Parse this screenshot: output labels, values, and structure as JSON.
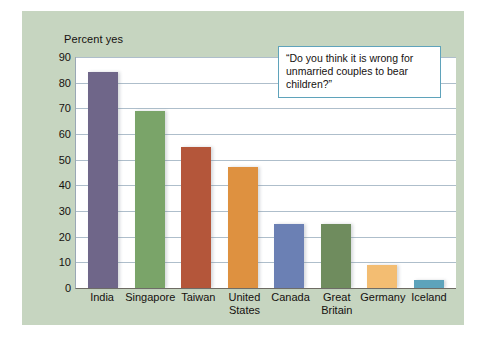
{
  "chart_data": {
    "type": "bar",
    "title": "",
    "annotation": "“Do you think it is wrong for unmarried couples to bear children?”",
    "xlabel": "",
    "ylabel": "Percent yes",
    "ylim": [
      0,
      90
    ],
    "ytick_step": 10,
    "yticks": [
      90,
      80,
      70,
      60,
      50,
      40,
      30,
      20,
      10,
      0
    ],
    "grid": true,
    "legend": "none",
    "categories": [
      "India",
      "Singapore",
      "Taiwan",
      "United States",
      "Canada",
      "Great Britain",
      "Germany",
      "Iceland"
    ],
    "values": [
      84,
      69,
      55,
      47,
      25,
      25,
      9,
      3
    ],
    "bar_colors": [
      "#6f6689",
      "#7aa469",
      "#b4563a",
      "#de9140",
      "#6b80b4",
      "#6f8c5e",
      "#f3bd72",
      "#5da3bb"
    ]
  },
  "palette": {
    "page_background": "#ffffff",
    "panel_background": "#c6d5c0",
    "plot_background": "#ffffff",
    "gridline": "#aebecb",
    "axis": "#6e6b63",
    "text": "#15110f",
    "callout_border": "#5fa3bb"
  }
}
